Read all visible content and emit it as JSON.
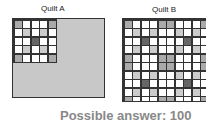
{
  "quilt_a": {
    "title": "Quilt A",
    "pattern_size": 5,
    "pattern": [
      [
        "med",
        "white",
        "white",
        "white",
        "med"
      ],
      [
        "white",
        "light",
        "white",
        "light",
        "white"
      ],
      [
        "white",
        "white",
        "dark",
        "white",
        "white"
      ],
      [
        "white",
        "light",
        "white",
        "light",
        "white"
      ],
      [
        "med",
        "white",
        "white",
        "white",
        "med"
      ]
    ]
  },
  "quilt_b": {
    "title": "Quilt B",
    "grid_size": 10,
    "description": "2x2 repetition of Quilt A pattern"
  },
  "answer": {
    "text": "Possible answer: 100"
  },
  "colors": {
    "border": "#333333",
    "med": "#aaaaaa",
    "light": "#cccccc",
    "dark": "#666666",
    "fill": "#c8c8c8",
    "answer_text": "#888888"
  }
}
